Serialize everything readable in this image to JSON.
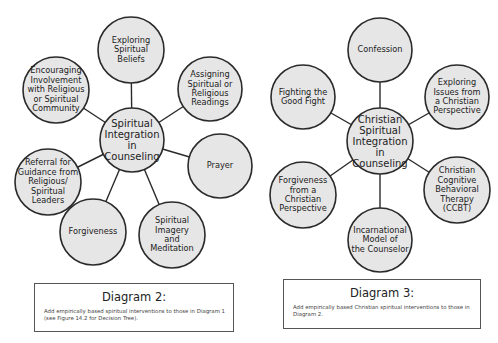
{
  "diagrams": [
    {
      "id": "diagram-2",
      "center": {
        "label": "Spiritual\nIntegration in\nCounseling",
        "cx": 132,
        "cy": 140,
        "r": 32
      },
      "nodes": [
        {
          "label": "Exploring\nSpiritual\nBeliefs",
          "cx": 131,
          "cy": 50,
          "r": 33
        },
        {
          "label": "Assigning\nSpiritual or\nReligious\nReadings",
          "cx": 210,
          "cy": 89,
          "r": 32
        },
        {
          "label": "Prayer",
          "cx": 220,
          "cy": 166,
          "r": 32
        },
        {
          "label": "Spiritual\nImagery\nand\nMeditation",
          "cx": 172,
          "cy": 235,
          "r": 33
        },
        {
          "label": "Forgiveness",
          "cx": 93,
          "cy": 232,
          "r": 33
        },
        {
          "label": "Referral for\nGuidance from\nReligious/\nSpiritual\nLeaders",
          "cx": 48,
          "cy": 182,
          "r": 33
        },
        {
          "label": "Encouraging\nInvolvement\nwith Religious\nor Spiritual\nCommunity",
          "cx": 56,
          "cy": 90,
          "r": 33
        }
      ],
      "caption": {
        "title": "Diagram 2:",
        "text": "Add empirically based spiritual interventions to those in Diagram 1 (see Figure 14.2 for Decision Tree).",
        "x": 34,
        "y": 283,
        "w": 200,
        "h": 49
      }
    },
    {
      "id": "diagram-3",
      "center": {
        "label": "Christian\nSpiritual\nIntegration in\nCounseling",
        "cx": 380,
        "cy": 141,
        "r": 33
      },
      "nodes": [
        {
          "label": "Confession",
          "cx": 380,
          "cy": 50,
          "r": 32
        },
        {
          "label": "Exploring\nIssues from\na Christian\nPerspective",
          "cx": 457,
          "cy": 97,
          "r": 32
        },
        {
          "label": "Christian\nCognitive\nBehavioral\nTherapy\n(CCBT)",
          "cx": 457,
          "cy": 190,
          "r": 33
        },
        {
          "label": "Incarnational\nModel of\nthe Counselor",
          "cx": 380,
          "cy": 240,
          "r": 32
        },
        {
          "label": "Forgiveness\nfrom a\nChristian\nPerspective",
          "cx": 303,
          "cy": 195,
          "r": 33
        },
        {
          "label": "Fighting the\nGood Fight",
          "cx": 303,
          "cy": 97,
          "r": 32
        }
      ],
      "caption": {
        "title": "Diagram 3:",
        "text": "Add empirically based Christian spiritual interventions to those in Diagram 2.",
        "x": 283,
        "y": 279,
        "w": 198,
        "h": 50
      }
    }
  ],
  "colors": {
    "circle_fill": "#e6e6e6",
    "stroke": "#2a2a2a",
    "background": "#ffffff"
  }
}
